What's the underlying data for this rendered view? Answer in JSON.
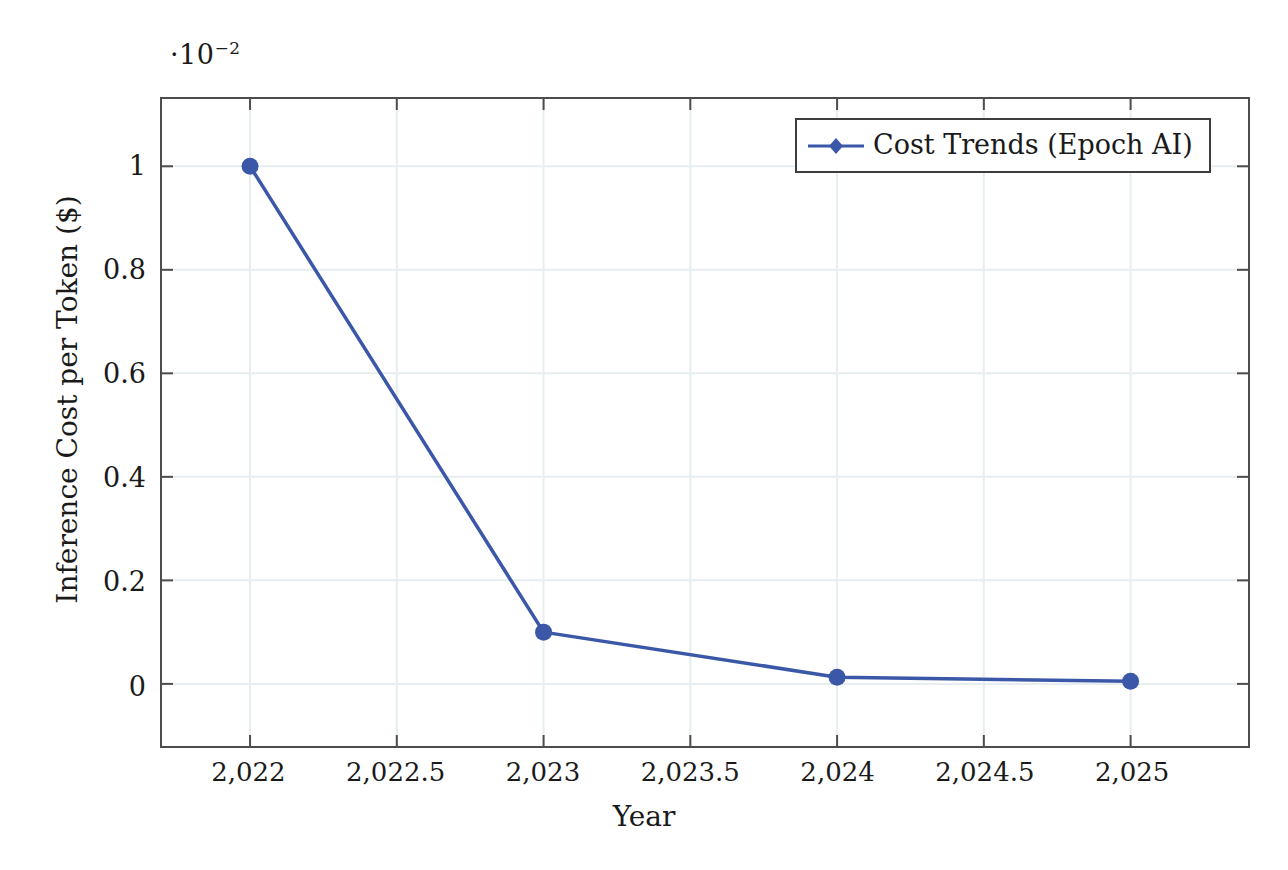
{
  "chart_data": {
    "type": "line",
    "title": "",
    "xlabel": "Year",
    "ylabel": "Inference Cost per Token ($)",
    "y_axis_multiplier": "·10",
    "y_axis_multiplier_exponent": "−2",
    "xlim": [
      2021.7,
      2025.4
    ],
    "ylim": [
      -0.12,
      1.13
    ],
    "grid": true,
    "legend_position": "top-right",
    "x": [
      2022,
      2023,
      2024,
      2025
    ],
    "values": [
      0.01,
      0.001,
      0.00013,
      5e-05
    ],
    "values_scaled": [
      1.0,
      0.1,
      0.013,
      0.005
    ],
    "series": [
      {
        "name": "Cost Trends (Epoch AI)",
        "color": "#3b58a8",
        "marker": "diamond",
        "values_scaled": [
          1.0,
          0.1,
          0.013,
          0.005
        ]
      }
    ],
    "xticks": [
      2022,
      2022.5,
      2023,
      2023.5,
      2024,
      2024.5,
      2025
    ],
    "xtick_labels": [
      "2,022",
      "2,022.5",
      "2,023",
      "2,023.5",
      "2,024",
      "2,024.5",
      "2,025"
    ],
    "yticks": [
      0,
      0.2,
      0.4,
      0.6,
      0.8,
      1
    ],
    "ytick_labels": [
      "0",
      "0.2",
      "0.4",
      "0.6",
      "0.8",
      "1"
    ]
  },
  "legend": {
    "entries": [
      {
        "label": "Cost Trends (Epoch AI)"
      }
    ]
  },
  "colors": {
    "series": "#3b58a8",
    "grid": "#e6eef1",
    "frame": "#4d4d4d",
    "text": "#1a1a1a"
  }
}
